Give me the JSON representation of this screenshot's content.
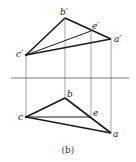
{
  "diagram": {
    "caption": "(b)",
    "axis": {
      "label": "projection-axis"
    },
    "front_view": {
      "points": {
        "a": {
          "label": "a′",
          "x": 111,
          "y": 39
        },
        "b": {
          "label": "b′",
          "x": 65,
          "y": 18
        },
        "c": {
          "label": "c′",
          "x": 26,
          "y": 55
        },
        "e": {
          "label": "e′",
          "x": 91,
          "y": 31
        }
      }
    },
    "top_view": {
      "points": {
        "a": {
          "label": "a",
          "x": 111,
          "y": 133
        },
        "b": {
          "label": "b",
          "x": 65,
          "y": 98
        },
        "c": {
          "label": "c",
          "x": 26,
          "y": 117
        },
        "e": {
          "label": "e",
          "x": 91,
          "y": 117
        }
      }
    },
    "colors": {
      "line": "#1a1a1a",
      "thin": "#555555"
    }
  }
}
